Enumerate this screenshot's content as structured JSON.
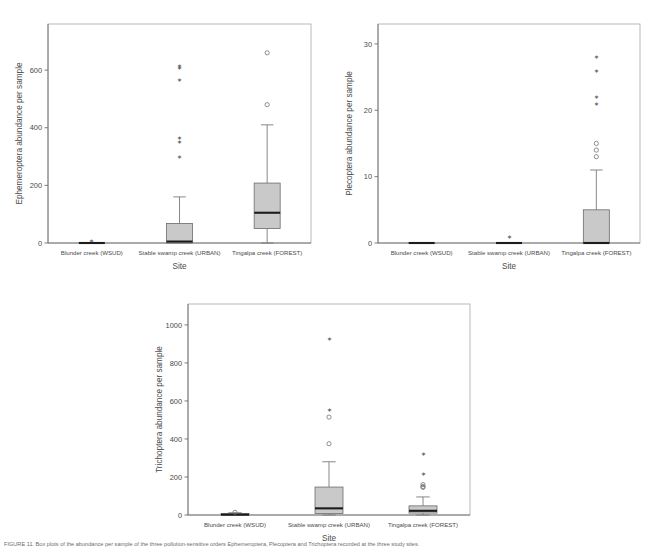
{
  "figure": {
    "caption_label": "FIGURE 11",
    "caption_text": "FIGURE 11. Box plots of the abundance per sample of the three pollution-sensitive orders Ephemeroptera, Plecoptera and Trichoptera recorded at the three study sites."
  },
  "shared": {
    "xlabel": "Site",
    "categories": [
      "Blunder creek (WSUD)",
      "Stable swamp creek (URBAN)",
      "Tingalpa creek (FOREST)"
    ]
  },
  "chart_data": [
    {
      "id": "ephemeroptera",
      "type": "box",
      "title": "",
      "xlabel": "Site",
      "ylabel": "Ephemeroptera abundance per sample",
      "ylim": [
        0,
        760
      ],
      "yticks": [
        0,
        200,
        400,
        600
      ],
      "ytick_labels": [
        "0",
        "200",
        "400",
        "600"
      ],
      "grid": false,
      "legend": "none",
      "categories": [
        "Blunder creek (WSUD)",
        "Stable swamp creek (URBAN)",
        "Tingalpa creek (FOREST)"
      ],
      "boxes": [
        {
          "category": "Blunder creek (WSUD)",
          "min": 0,
          "q1": 0,
          "median": 0,
          "q3": 0,
          "max": 0,
          "outliers_star": [
            6
          ],
          "outliers_circle": []
        },
        {
          "category": "Stable swamp creek (URBAN)",
          "min": 0,
          "q1": 0,
          "median": 5,
          "q3": 68,
          "max": 160,
          "outliers_star": [
            615,
            607,
            568,
            366,
            352,
            300
          ],
          "outliers_circle": []
        },
        {
          "category": "Tingalpa creek (FOREST)",
          "min": 0,
          "q1": 50,
          "median": 105,
          "q3": 208,
          "max": 410,
          "outliers_star": [],
          "outliers_circle": [
            660,
            480
          ]
        }
      ]
    },
    {
      "id": "plecoptera",
      "type": "box",
      "title": "",
      "xlabel": "Site",
      "ylabel": "Plecoptera abundance per sample",
      "ylim": [
        0,
        33
      ],
      "yticks": [
        0,
        10,
        20,
        30
      ],
      "ytick_labels": [
        "0",
        "10",
        "20",
        "30"
      ],
      "grid": false,
      "legend": "none",
      "categories": [
        "Blunder creek (WSUD)",
        "Stable swamp creek (URBAN)",
        "Tingalpa creek (FOREST)"
      ],
      "boxes": [
        {
          "category": "Blunder creek (WSUD)",
          "min": 0,
          "q1": 0,
          "median": 0,
          "q3": 0,
          "max": 0,
          "outliers_star": [],
          "outliers_circle": []
        },
        {
          "category": "Stable swamp creek (URBAN)",
          "min": 0,
          "q1": 0,
          "median": 0,
          "q3": 0,
          "max": 0,
          "outliers_star": [
            1
          ],
          "outliers_circle": []
        },
        {
          "category": "Tingalpa creek (FOREST)",
          "min": 0,
          "q1": 0,
          "median": 0,
          "q3": 5,
          "max": 11,
          "outliers_star": [
            28,
            26,
            22,
            21
          ],
          "outliers_circle": [
            15,
            14,
            13
          ]
        }
      ]
    },
    {
      "id": "trichoptera",
      "type": "box",
      "title": "",
      "xlabel": "Site",
      "ylabel": "Trichoptera abundance per sample",
      "ylim": [
        0,
        1110
      ],
      "yticks": [
        0,
        200,
        400,
        600,
        800,
        1000
      ],
      "ytick_labels": [
        "0",
        "200",
        "400",
        "600",
        "800",
        "1000"
      ],
      "grid": false,
      "legend": "none",
      "categories": [
        "Blunder creek (WSUD)",
        "Stable swamp creek (URBAN)",
        "Tingalpa creek (FOREST)"
      ],
      "boxes": [
        {
          "category": "Blunder creek (WSUD)",
          "min": 0,
          "q1": 0,
          "median": 2,
          "q3": 8,
          "max": 12,
          "outliers_star": [],
          "outliers_circle": [
            14
          ]
        },
        {
          "category": "Stable swamp creek (URBAN)",
          "min": 0,
          "q1": 8,
          "median": 35,
          "q3": 147,
          "max": 280,
          "outliers_star": [
            925,
            555
          ],
          "outliers_circle": [
            515,
            375
          ]
        },
        {
          "category": "Tingalpa creek (FOREST)",
          "min": 0,
          "q1": 10,
          "median": 22,
          "q3": 48,
          "max": 95,
          "outliers_star": [
            320,
            215
          ],
          "outliers_circle": [
            160,
            150,
            145
          ]
        }
      ]
    }
  ]
}
